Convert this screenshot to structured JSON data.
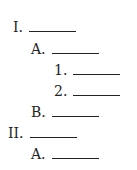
{
  "outline": [
    {
      "label": "I.",
      "level": 1,
      "x": 13,
      "y": 19
    },
    {
      "label": "A.",
      "level": 2,
      "x": 31,
      "y": 41
    },
    {
      "label": "1.",
      "level": 3,
      "x": 54,
      "y": 62
    },
    {
      "label": "2.",
      "level": 3,
      "x": 54,
      "y": 83
    },
    {
      "label": "B.",
      "level": 2,
      "x": 31,
      "y": 104
    },
    {
      "label": "II.",
      "level": 1,
      "x": 8,
      "y": 125
    },
    {
      "label": "A.",
      "level": 2,
      "x": 31,
      "y": 146
    }
  ]
}
